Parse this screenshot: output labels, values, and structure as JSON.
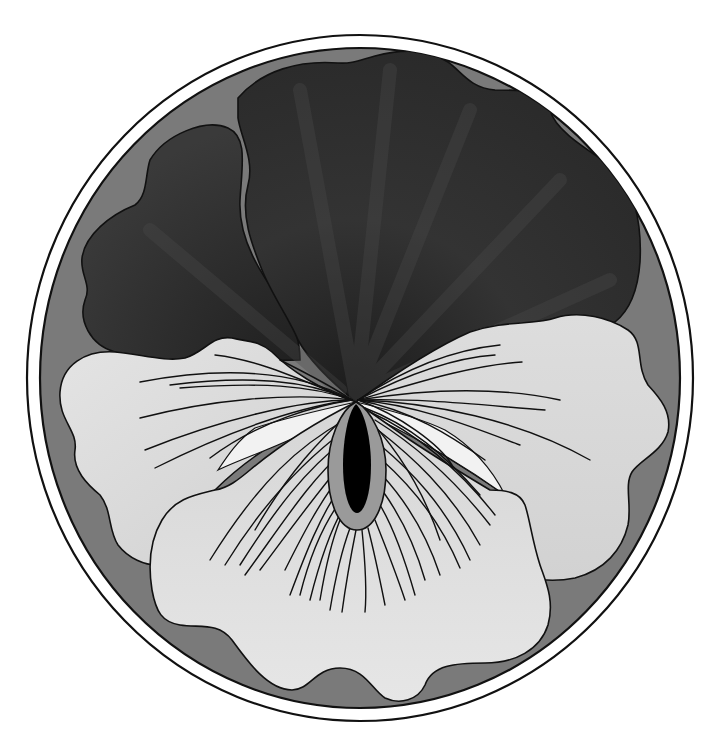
{
  "image": {
    "subject": "Pansy flower illustration in a circular frame",
    "style": "grayscale vector illustration"
  },
  "colors": {
    "background": "#ffffff",
    "frame_ring": "#ffffff",
    "outline": "#111111",
    "disc": "#7a7a7a",
    "dark_petal_light": "#555555",
    "dark_petal_dark": "#262626",
    "light_petal_light": "#e8e8e8",
    "light_petal_mid": "#c9c9c9",
    "highlight": "#f4f4f4",
    "eye_ring": "#9a9a9a",
    "eye_center": "#000000"
  },
  "elements": {
    "frame": "Double-outlined circular frame",
    "upper_petals": [
      "top dark petal",
      "left dark petal"
    ],
    "side_petals": [
      "left light petal",
      "right light petal"
    ],
    "lower_petal": "bottom light petal with radiating veins",
    "eye": "black elongated center with gray ring"
  }
}
